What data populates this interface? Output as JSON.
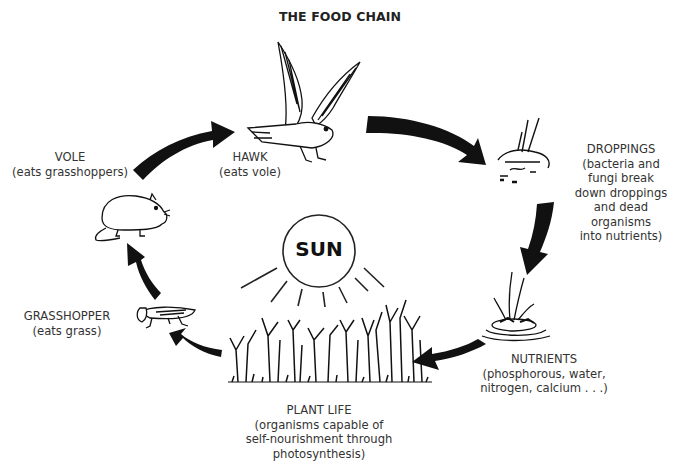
{
  "title": "THE FOOD CHAIN",
  "center": {
    "label": "SUN",
    "icon": "sun-icon"
  },
  "nodes": [
    {
      "id": "hawk",
      "name": "HAWK",
      "desc": [
        "(eats vole)"
      ],
      "icon": "hawk-icon"
    },
    {
      "id": "droppings",
      "name": "DROPPINGS",
      "desc": [
        "(bacteria and",
        "fungi break",
        "down droppings",
        "and dead organisms",
        "into nutrients)"
      ],
      "icon": "droppings-icon"
    },
    {
      "id": "nutrients",
      "name": "NUTRIENTS",
      "desc": [
        "(phosphorous, water,",
        "nitrogen, calcium . . .)"
      ],
      "icon": "nutrients-icon"
    },
    {
      "id": "plant-life",
      "name": "PLANT LIFE",
      "desc": [
        "(organisms capable of",
        "self-nourishment through",
        "photosynthesis)"
      ],
      "icon": "plants-icon"
    },
    {
      "id": "grasshopper",
      "name": "GRASSHOPPER",
      "desc": [
        "(eats grass)"
      ],
      "icon": "grasshopper-icon"
    },
    {
      "id": "vole",
      "name": "VOLE",
      "desc": [
        "(eats grasshoppers)"
      ],
      "icon": "vole-icon"
    }
  ],
  "flow": [
    {
      "from": "vole",
      "to": "hawk"
    },
    {
      "from": "hawk",
      "to": "droppings"
    },
    {
      "from": "droppings",
      "to": "nutrients"
    },
    {
      "from": "nutrients",
      "to": "plant-life"
    },
    {
      "from": "plant-life",
      "to": "grasshopper"
    },
    {
      "from": "grasshopper",
      "to": "vole"
    }
  ],
  "colors": {
    "arrow": "#111111",
    "text": "#333333",
    "background": "#ffffff"
  }
}
